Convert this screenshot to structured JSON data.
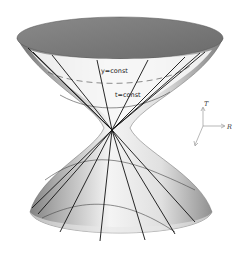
{
  "figure": {
    "labels": {
      "upper_curve": "y=const",
      "lower_curve": "t=const"
    },
    "axes": {
      "vertical": "T",
      "horizontal": "R",
      "depth": ""
    },
    "colors": {
      "top_cap": "#7a7a7a",
      "surface_light": "#f2f2f2",
      "surface_dark": "#8c8c8c",
      "lines": "#111111"
    }
  }
}
